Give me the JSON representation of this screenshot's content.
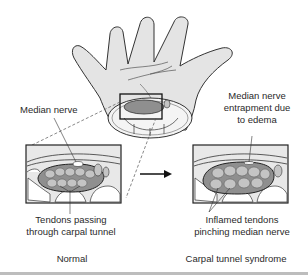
{
  "diagram": {
    "topic": "Carpal tunnel syndrome",
    "labels": {
      "median_nerve": "Median nerve",
      "entrapment_line1": "Median nerve",
      "entrapment_line2": "entrapment due",
      "entrapment_line3": "to edema",
      "tendons_line1": "Tendons passing",
      "tendons_line2": "through carpal tunnel",
      "inflamed_line1": "Inflamed tendons",
      "inflamed_line2": "pinching median nerve"
    },
    "captions": {
      "left": "Normal",
      "right": "Carpal tunnel syndrome"
    },
    "colors": {
      "skin": "#e4e4e4",
      "outline": "#333333",
      "tunnel_fill": "#8f8f8f",
      "tendon_fill": "#c4c4c4",
      "bone_fill": "#ffffff",
      "panel_bg": "#e8e8e8"
    }
  }
}
